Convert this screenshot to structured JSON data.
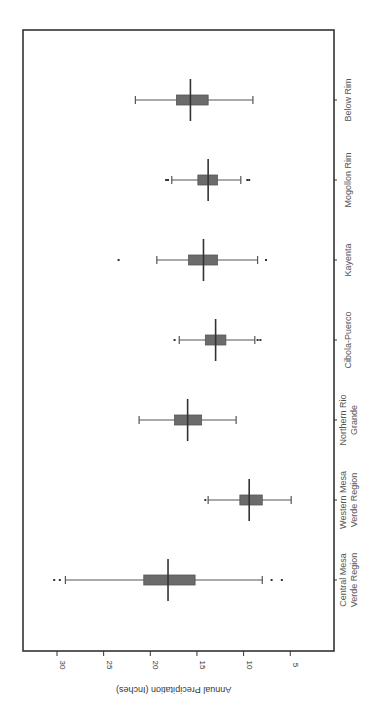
{
  "chart_data": {
    "type": "box",
    "orientation": "rotated-90",
    "title": "",
    "xlabel": "",
    "ylabel": "Annual Precipitation (Inches)",
    "ylim": [
      2,
      32
    ],
    "yticks": [
      30,
      25,
      20,
      15,
      10,
      5
    ],
    "grid": false,
    "legend": null,
    "categories": [
      "Central Mesa Verde Region",
      "Western Mesa Verde Region",
      "Northern Rio Grande",
      "Cibola-Puerco",
      "Kayenta",
      "Mogollon Rim",
      "Below Rim"
    ],
    "category_lines": [
      [
        "Central Mesa",
        "Verde Region"
      ],
      [
        "Western Mesa",
        "Verde Region"
      ],
      [
        "Northern Rio",
        "Grande"
      ],
      [
        "Cibola-Puerco"
      ],
      [
        "Kayenta"
      ],
      [
        "Mogollon Rim"
      ],
      [
        "Below Rim"
      ]
    ],
    "series": [
      {
        "name": "Central Mesa Verde Region",
        "whisker_low": 8.0,
        "q1": 15.2,
        "median": 18.1,
        "q3": 20.7,
        "whisker_high": 29.1,
        "outliers": [
          30.3,
          29.7,
          7.0,
          5.9
        ]
      },
      {
        "name": "Western Mesa Verde Region",
        "whisker_low": 4.9,
        "q1": 8.0,
        "median": 9.4,
        "q3": 10.4,
        "whisker_high": 13.8,
        "outliers": [
          14.1
        ]
      },
      {
        "name": "Northern Rio Grande",
        "whisker_low": 10.8,
        "q1": 14.5,
        "median": 16.0,
        "q3": 17.4,
        "whisker_high": 21.2,
        "outliers": []
      },
      {
        "name": "Cibola-Puerco",
        "whisker_low": 8.8,
        "q1": 11.9,
        "median": 13.0,
        "q3": 14.1,
        "whisker_high": 16.9,
        "outliers": [
          17.4,
          8.5,
          8.2
        ]
      },
      {
        "name": "Kayenta",
        "whisker_low": 8.5,
        "q1": 12.8,
        "median": 14.3,
        "q3": 15.9,
        "whisker_high": 19.3,
        "outliers": [
          23.4,
          7.6
        ]
      },
      {
        "name": "Mogollon Rim",
        "whisker_low": 10.3,
        "q1": 12.8,
        "median": 13.8,
        "q3": 14.9,
        "whisker_high": 17.7,
        "outliers": [
          18.3,
          18.1,
          9.6,
          9.4
        ]
      },
      {
        "name": "Below Rim",
        "whisker_low": 9.0,
        "q1": 13.8,
        "median": 15.7,
        "q3": 17.2,
        "whisker_high": 21.6,
        "outliers": []
      }
    ]
  },
  "layout": {
    "frame": {
      "left": 23,
      "top": 30,
      "right": 334,
      "bottom": 651
    },
    "value_axis": {
      "x_at_30": 57,
      "px_per_unit": 9.33
    },
    "category_y": [
      580,
      500,
      420,
      340,
      260,
      180,
      100
    ],
    "box_half_height": 5,
    "median_half_height": 21,
    "cap_half_height": 4
  }
}
